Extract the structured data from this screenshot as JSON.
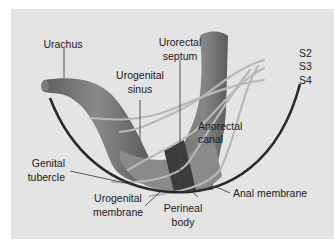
{
  "diagram": {
    "type": "anatomical-illustration",
    "colors": {
      "background": "#e4e4e4",
      "tissue": "#6e6e6e",
      "tissue_dark": "#3c3c3c",
      "nerves": "#b4b4b4",
      "body_wall": "#2a2a2a",
      "leader_lines": "#444444"
    },
    "labels": {
      "urachus": "Urachus",
      "urorectal_septum_1": "Urorectal",
      "urorectal_septum_2": "septum",
      "urogenital_sinus_1": "Urogenital",
      "urogenital_sinus_2": "sinus",
      "s2": "S2",
      "s3": "S3",
      "s4": "S4",
      "anorectal_canal_1": "Anorectal",
      "anorectal_canal_2": "canal",
      "genital_tubercle_1": "Genital",
      "genital_tubercle_2": "tubercle",
      "urogenital_membrane_1": "Urogenital",
      "urogenital_membrane_2": "membrane",
      "perineal_body_1": "Perineal",
      "perineal_body_2": "body",
      "anal_membrane": "Anal membrane"
    }
  }
}
